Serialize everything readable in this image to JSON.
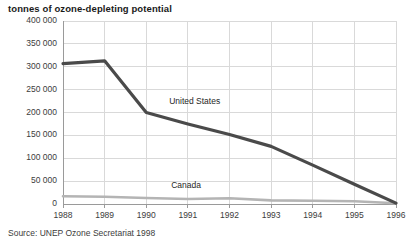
{
  "chart_data": {
    "type": "line",
    "title": "tonnes of ozone-depleting potential",
    "xlabel": "",
    "ylabel": "",
    "x": [
      1988,
      1989,
      1990,
      1991,
      1992,
      1993,
      1994,
      1995,
      1996
    ],
    "xtick_labels": [
      "1988",
      "1989",
      "1990",
      "1991",
      "1992",
      "1993",
      "1994",
      "1995",
      "1996"
    ],
    "ytick_labels": [
      "0",
      "50 000",
      "100 000",
      "150 000",
      "200 000",
      "250 000",
      "300 000",
      "350 000",
      "400 000"
    ],
    "ytick_values": [
      0,
      50000,
      100000,
      150000,
      200000,
      250000,
      300000,
      350000,
      400000
    ],
    "ylim": [
      0,
      400000
    ],
    "xlim": [
      1988,
      1996
    ],
    "grid": true,
    "legend_position": "inline-annotation",
    "series": [
      {
        "name": "United States",
        "color": "#4a4a4a",
        "values": [
          307000,
          313000,
          200000,
          175000,
          152000,
          126000,
          85000,
          43000,
          2000
        ],
        "label_x": 1990.55,
        "label_y": 222000
      },
      {
        "name": "Canada",
        "color": "#b4b4b4",
        "values": [
          17000,
          16000,
          13000,
          11000,
          12500,
          8000,
          7000,
          6000,
          1500
        ],
        "label_x": 1990.6,
        "label_y": 40000
      }
    ],
    "source": "Source: UNEP Ozone Secretariat 1998"
  },
  "style": {
    "grid_color": "#d9d9d9",
    "axis_color": "#9a9a9a",
    "text_color": "#3c3c3c",
    "title_color": "#1a1a1a",
    "background": "#ffffff"
  }
}
